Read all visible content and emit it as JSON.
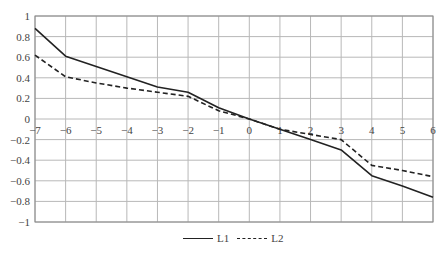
{
  "chart_data": {
    "type": "line",
    "title": "",
    "xlabel": "",
    "ylabel": "",
    "xlim": [
      -7,
      6
    ],
    "ylim": [
      -1,
      1
    ],
    "grid": true,
    "legend_position": "bottom-center",
    "x": [
      -7,
      -6,
      -5,
      -4,
      -3,
      -2,
      -1,
      0,
      1,
      2,
      3,
      4,
      5,
      6
    ],
    "x_ticks": [
      "-7",
      "-6",
      "-5",
      "-4",
      "-3",
      "-2",
      "-1",
      "0",
      "1",
      "2",
      "3",
      "4",
      "5",
      "6"
    ],
    "y_ticks": [
      "1",
      "0.8",
      "0.6",
      "0.4",
      "0.2",
      "0",
      "-0.2",
      "-0.4",
      "-0.6",
      "-0.8",
      "-1"
    ],
    "series": [
      {
        "name": "L1",
        "style": "solid",
        "color": "#222222",
        "values": [
          0.88,
          0.61,
          0.51,
          0.41,
          0.31,
          0.26,
          0.11,
          0.0,
          -0.1,
          -0.2,
          -0.3,
          -0.55,
          -0.65,
          -0.76
        ]
      },
      {
        "name": "L2",
        "style": "dashed",
        "color": "#222222",
        "values": [
          0.62,
          0.41,
          0.35,
          0.3,
          0.26,
          0.22,
          0.08,
          0.0,
          -0.1,
          -0.15,
          -0.2,
          -0.45,
          -0.5,
          -0.56
        ]
      }
    ]
  },
  "legend": {
    "items": [
      {
        "label": "L1"
      },
      {
        "label": "L2"
      }
    ]
  }
}
